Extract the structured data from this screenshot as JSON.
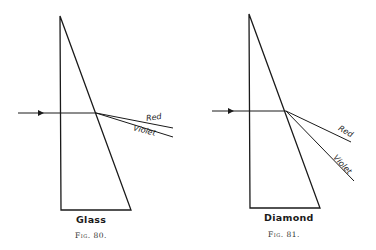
{
  "figures": [
    {
      "id": "fig80",
      "caption": "Fig. 80.",
      "material": "Glass",
      "rays": [
        {
          "label": "Red"
        },
        {
          "label": "Violet"
        }
      ]
    },
    {
      "id": "fig81",
      "caption": "Fig. 81.",
      "material": "Diamond",
      "rays": [
        {
          "label": "Red"
        },
        {
          "label": "Violet"
        }
      ]
    }
  ],
  "colors": {
    "line": "#1a1a1a",
    "background": "#ffffff"
  }
}
